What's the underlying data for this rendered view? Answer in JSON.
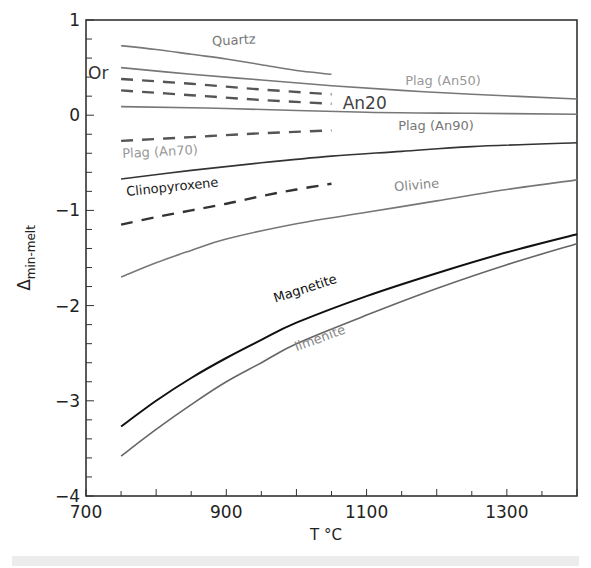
{
  "chart_data": {
    "type": "line",
    "title": "",
    "xlabel": "T °C",
    "ylabel": "Δ",
    "ylabel_subscript": "min-melt",
    "xlim": [
      700,
      1400
    ],
    "ylim": [
      -4,
      1
    ],
    "x_ticks": [
      700,
      900,
      1100,
      1300
    ],
    "x_minor_step": 50,
    "y_ticks": [
      1,
      0,
      -1,
      -2,
      -3,
      -4
    ],
    "y_minor_step": 0.2,
    "grid": false,
    "series": [
      {
        "name": "Quartz",
        "style": "solid",
        "color": "#777777",
        "label_color": "#777777",
        "x": [
          750,
          800,
          850,
          900,
          950,
          1000,
          1050
        ],
        "y": [
          0.73,
          0.69,
          0.64,
          0.59,
          0.53,
          0.47,
          0.43
        ],
        "label": {
          "text": "Quartz",
          "x": 880,
          "y": 0.73,
          "angle": -3
        }
      },
      {
        "name": "Plag (An50)",
        "style": "solid",
        "color": "#777777",
        "label_color": "#999999",
        "x": [
          750,
          850,
          950,
          1050,
          1150,
          1250,
          1400
        ],
        "y": [
          0.5,
          0.43,
          0.37,
          0.31,
          0.26,
          0.22,
          0.17
        ],
        "label": {
          "text": "Plag (An50)",
          "x": 1155,
          "y": 0.32,
          "angle": 0
        }
      },
      {
        "name": "Or",
        "style": "dashed",
        "color": "#555555",
        "label_color": "#333333",
        "x": [
          750,
          850,
          950,
          1050
        ],
        "y": [
          0.38,
          0.33,
          0.27,
          0.22
        ],
        "label": {
          "text": "Or",
          "x": 703,
          "y": 0.38,
          "angle": 0
        }
      },
      {
        "name": "An20",
        "style": "dashed",
        "color": "#555555",
        "label_color": "#444444",
        "x": [
          750,
          850,
          950,
          1050
        ],
        "y": [
          0.26,
          0.21,
          0.16,
          0.12
        ],
        "label": {
          "text": "An20",
          "x": 1066,
          "y": 0.07,
          "angle": 0
        }
      },
      {
        "name": "Plag (An90)",
        "style": "solid",
        "color": "#777777",
        "label_color": "#777777",
        "x": [
          750,
          900,
          1100,
          1250,
          1400
        ],
        "y": [
          0.09,
          0.07,
          0.03,
          0.02,
          0.01
        ],
        "label": {
          "text": "Plag (An90)",
          "x": 1145,
          "y": -0.16,
          "angle": 0
        }
      },
      {
        "name": "Plag (An70)",
        "style": "dashed",
        "color": "#555555",
        "label_color": "#999999",
        "x": [
          750,
          850,
          950,
          1050
        ],
        "y": [
          -0.27,
          -0.23,
          -0.19,
          -0.16
        ],
        "label": {
          "text": "Plag (An70)",
          "x": 752,
          "y": -0.45,
          "angle": -3
        }
      },
      {
        "name": "Clinopyroxene",
        "style": "solid",
        "color": "#333333",
        "label_color": "#222222",
        "x": [
          750,
          850,
          950,
          1050,
          1150,
          1250,
          1400
        ],
        "y": [
          -0.67,
          -0.58,
          -0.5,
          -0.43,
          -0.38,
          -0.33,
          -0.29
        ],
        "label": {
          "text": "Clinopyroxene",
          "x": 758,
          "y": -0.85,
          "angle": -6
        }
      },
      {
        "name": "Clinopyroxene (dashed)",
        "style": "dashed",
        "color": "#333333",
        "label_color": "#333333",
        "x": [
          750,
          800,
          850,
          900,
          950,
          1000,
          1050
        ],
        "y": [
          -1.15,
          -1.07,
          -1.0,
          -0.93,
          -0.85,
          -0.78,
          -0.72
        ],
        "label": null
      },
      {
        "name": "Olivine",
        "style": "solid",
        "color": "#777777",
        "label_color": "#888888",
        "x": [
          750,
          800,
          850,
          900,
          1000,
          1100,
          1200,
          1300,
          1400
        ],
        "y": [
          -1.7,
          -1.55,
          -1.42,
          -1.3,
          -1.14,
          -1.02,
          -0.9,
          -0.78,
          -0.68
        ],
        "label": {
          "text": "Olivine",
          "x": 1140,
          "y": -0.8,
          "angle": -5
        }
      },
      {
        "name": "Magnetite",
        "style": "solid",
        "color": "#111111",
        "label_color": "#111111",
        "x": [
          750,
          800,
          850,
          900,
          950,
          1000,
          1100,
          1200,
          1300,
          1400
        ],
        "y": [
          -3.27,
          -3.0,
          -2.76,
          -2.55,
          -2.36,
          -2.18,
          -1.9,
          -1.66,
          -1.44,
          -1.25
        ],
        "label": {
          "text": "Magnetite",
          "x": 970,
          "y": -1.97,
          "angle": -18
        }
      },
      {
        "name": "Ilmenite",
        "style": "solid",
        "color": "#666666",
        "label_color": "#888888",
        "x": [
          750,
          800,
          850,
          900,
          950,
          1000,
          1100,
          1200,
          1300,
          1400
        ],
        "y": [
          -3.58,
          -3.3,
          -3.04,
          -2.8,
          -2.6,
          -2.4,
          -2.1,
          -1.82,
          -1.57,
          -1.35
        ],
        "label": {
          "text": "Ilmenite",
          "x": 1000,
          "y": -2.48,
          "angle": -20
        }
      }
    ]
  }
}
